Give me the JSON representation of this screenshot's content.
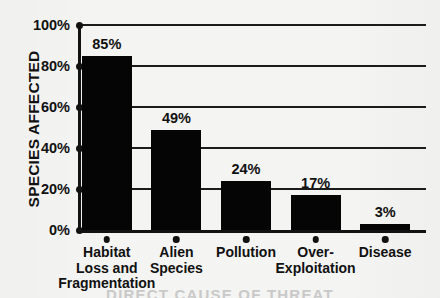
{
  "chart_data": {
    "type": "bar",
    "title": "",
    "xlabel": "DIRECT CAUSE OF THREAT",
    "ylabel": "SPECIES AFFECTED",
    "categories": [
      "Habitat\nLoss and\nFragmentation",
      "Alien\nSpecies",
      "Pollution",
      "Over-\nExploitation",
      "Disease"
    ],
    "values": [
      85,
      49,
      24,
      17,
      3
    ],
    "value_labels": [
      "85%",
      "49%",
      "24%",
      "17%",
      "3%"
    ],
    "ylim": [
      0,
      100
    ],
    "ytick_values": [
      0,
      20,
      40,
      60,
      80,
      100
    ],
    "ytick_labels": [
      "0%",
      "20%",
      "40%",
      "60%",
      "80%",
      "100%"
    ],
    "grid": true,
    "legend": "none",
    "bar_color": "#050505",
    "axis_color": "#121212",
    "background_color": "#f4f4f2"
  }
}
